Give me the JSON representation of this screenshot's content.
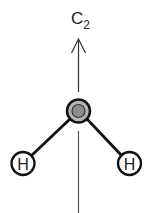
{
  "diagram": {
    "axis_label": {
      "main": "C",
      "subscript": "2"
    },
    "atoms": [
      {
        "symbol": "O",
        "role": "center",
        "fill": "#9a9a9a"
      },
      {
        "symbol": "H",
        "role": "left",
        "fill": "#ffffff"
      },
      {
        "symbol": "H",
        "role": "right",
        "fill": "#ffffff"
      }
    ],
    "colors": {
      "stroke": "#111111",
      "axis": "#333333",
      "oxygen_fill": "#9a9a9a"
    }
  }
}
